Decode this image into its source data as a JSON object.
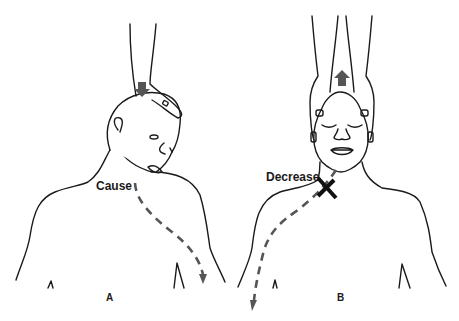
{
  "panels": [
    {
      "id": "A",
      "label": "A",
      "annotation": "Cause",
      "force_direction": "down"
    },
    {
      "id": "B",
      "label": "B",
      "annotation": "Decrease",
      "force_direction": "up"
    }
  ],
  "colors": {
    "outline": "#1a1a1a",
    "arrow": "#555555",
    "background": "#ffffff"
  }
}
